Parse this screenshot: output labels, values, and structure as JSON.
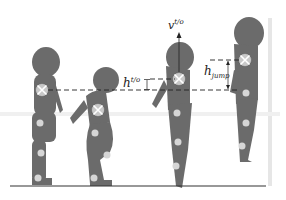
{
  "diagram": {
    "colors": {
      "body": "#6b6b6b",
      "joint": "#d6d6d6",
      "com_light": "#c8c8c8",
      "com_dark": "#9a9a9a",
      "line": "#222222",
      "ground": "#333333"
    },
    "labels": {
      "h_to_base": "h",
      "h_to_sup": "t/o",
      "v_to_base": "v",
      "v_to_sup": "t/o",
      "h_jump_base": "h",
      "h_jump_sub": "jump"
    },
    "figures": [
      {
        "phase": "standing"
      },
      {
        "phase": "crouch"
      },
      {
        "phase": "take-off"
      },
      {
        "phase": "apex"
      }
    ]
  }
}
